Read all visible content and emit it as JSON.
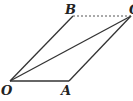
{
  "diagram": {
    "type": "parallelogram-vector-addition",
    "points": {
      "O": {
        "label": "O",
        "x": 10,
        "y": 81
      },
      "A": {
        "label": "A",
        "x": 69,
        "y": 81
      },
      "B": {
        "label": "B",
        "x": 73,
        "y": 16
      },
      "C": {
        "label": "C",
        "x": 131,
        "y": 16
      }
    },
    "segments": [
      {
        "from": "O",
        "to": "A",
        "style": "solid"
      },
      {
        "from": "O",
        "to": "B",
        "style": "solid"
      },
      {
        "from": "A",
        "to": "C",
        "style": "solid"
      },
      {
        "from": "O",
        "to": "C",
        "style": "solid"
      },
      {
        "from": "B",
        "to": "C",
        "style": "dashed"
      }
    ],
    "colors": {
      "line": "#333333",
      "background": "#ffffff"
    }
  }
}
